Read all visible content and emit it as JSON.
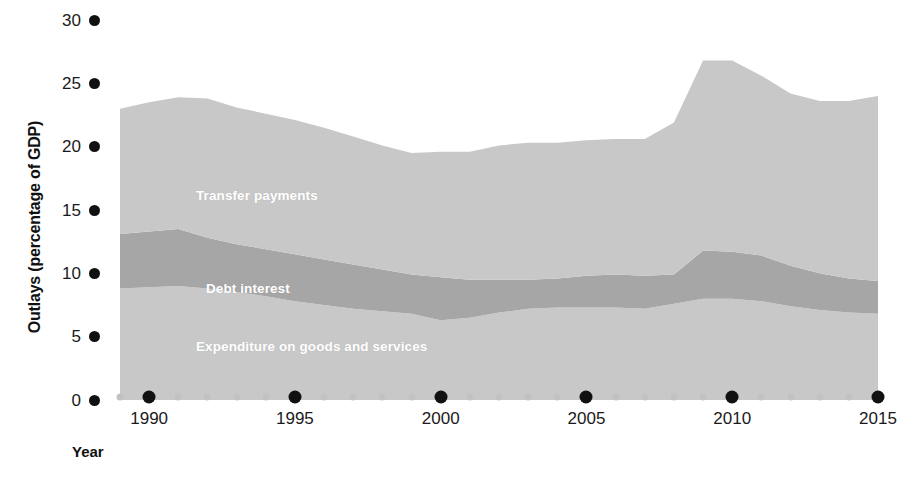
{
  "chart_data": {
    "type": "area",
    "stacked": true,
    "title": "",
    "xlabel": "Year",
    "ylabel": "Outlays (percentage of GDP)",
    "xlim": [
      1989,
      2015
    ],
    "ylim": [
      0,
      30
    ],
    "y_ticks": [
      0,
      5,
      10,
      15,
      20,
      25,
      30
    ],
    "x_ticks_major": [
      1990,
      1995,
      2000,
      2005,
      2010,
      2015
    ],
    "x_ticks_minor": [
      1989,
      1991,
      1992,
      1993,
      1994,
      1996,
      1997,
      1998,
      1999,
      2001,
      2002,
      2003,
      2004,
      2006,
      2007,
      2008,
      2009,
      2011,
      2012,
      2013,
      2014
    ],
    "grid": false,
    "legend_position": "inline-band-labels",
    "x": [
      1989,
      1990,
      1991,
      1992,
      1993,
      1994,
      1995,
      1996,
      1997,
      1998,
      1999,
      2000,
      2001,
      2002,
      2003,
      2004,
      2005,
      2006,
      2007,
      2008,
      2009,
      2010,
      2011,
      2012,
      2013,
      2014,
      2015
    ],
    "series": [
      {
        "name": "Expenditure on goods and services",
        "color": "#c8c8c8",
        "values": [
          8.8,
          8.9,
          9.0,
          8.8,
          8.5,
          8.2,
          7.8,
          7.5,
          7.2,
          7.0,
          6.8,
          6.3,
          6.5,
          6.9,
          7.2,
          7.3,
          7.3,
          7.3,
          7.2,
          7.6,
          8.0,
          8.0,
          7.8,
          7.4,
          7.1,
          6.9,
          6.8
        ]
      },
      {
        "name": "Debt interest",
        "color": "#a6a6a6",
        "values": [
          4.3,
          4.4,
          4.5,
          4.0,
          3.8,
          3.7,
          3.7,
          3.6,
          3.5,
          3.3,
          3.1,
          3.4,
          3.0,
          2.6,
          2.3,
          2.3,
          2.5,
          2.6,
          2.6,
          2.3,
          3.8,
          3.7,
          3.6,
          3.2,
          2.9,
          2.7,
          2.6
        ]
      },
      {
        "name": "Transfer payments",
        "color": "#c8c8c8",
        "values": [
          9.9,
          10.2,
          10.4,
          11.0,
          10.8,
          10.7,
          10.6,
          10.4,
          10.1,
          9.8,
          9.6,
          9.9,
          10.1,
          10.6,
          10.8,
          10.7,
          10.7,
          10.7,
          10.8,
          12.0,
          15.0,
          15.1,
          14.2,
          13.6,
          13.6,
          14.0,
          14.6
        ]
      }
    ],
    "total_outlays": [
      23.0,
      23.5,
      23.9,
      23.8,
      23.1,
      22.6,
      22.1,
      21.5,
      20.8,
      20.1,
      19.5,
      19.6,
      19.6,
      20.1,
      20.3,
      20.3,
      20.5,
      20.6,
      20.6,
      21.9,
      26.8,
      26.8,
      25.6,
      24.2,
      23.6,
      23.6,
      24.0
    ]
  },
  "axes": {
    "y_title": "Outlays (percentage of GDP)",
    "x_title": "Year",
    "y_tick_labels": [
      "30",
      "25",
      "20",
      "15",
      "10",
      "5",
      "0"
    ],
    "x_tick_labels": [
      "1990",
      "1995",
      "2000",
      "2005",
      "2010",
      "2015"
    ]
  },
  "band_labels": {
    "transfer": "Transfer payments",
    "debt": "Debt interest",
    "expenditure": "Expenditure on goods and services"
  },
  "colors": {
    "band_light": "#c8c8c8",
    "band_dark": "#a6a6a6",
    "tick_major": "#111111",
    "tick_minor": "#c2c2c2",
    "text": "#111111",
    "label_text": "#ffffff"
  }
}
